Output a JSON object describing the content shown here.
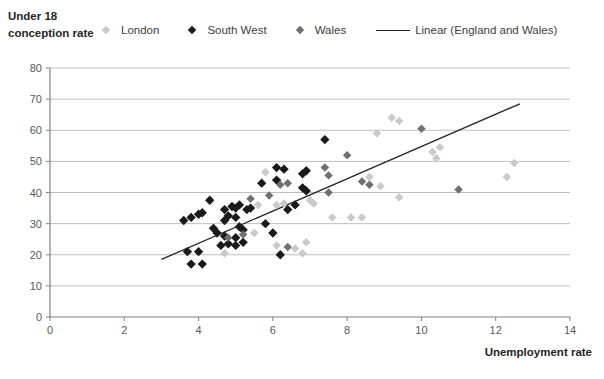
{
  "chart": {
    "y_axis_title": "Under 18\nconception rate",
    "x_axis_title": "Unemployment rate"
  },
  "legend": [
    {
      "label": "London",
      "marker": "diamond",
      "color": "#c9c9c9"
    },
    {
      "label": "South West",
      "marker": "diamond",
      "color": "#1a1a1a"
    },
    {
      "label": "Wales",
      "marker": "diamond",
      "color": "#707070"
    },
    {
      "label": "Linear (England and Wales)",
      "marker": "line",
      "color": "#262626"
    }
  ],
  "colors": {
    "gridline": "#bfbfbf",
    "axis": "#808080",
    "tick_label": "#595959",
    "trendline": "#262626"
  },
  "chart_data": {
    "type": "scatter",
    "title": "",
    "xlabel": "Unemployment rate",
    "ylabel": "Under 18 conception rate",
    "xlim": [
      0,
      14
    ],
    "ylim": [
      0,
      80
    ],
    "xticks": [
      0,
      2,
      4,
      6,
      8,
      10,
      12,
      14
    ],
    "yticks": [
      0,
      10,
      20,
      30,
      40,
      50,
      60,
      70,
      80
    ],
    "grid": true,
    "legend_position": "top",
    "series": [
      {
        "name": "London",
        "color": "#c9c9c9",
        "marker": "diamond",
        "points": [
          [
            4.7,
            20.5
          ],
          [
            5.5,
            27
          ],
          [
            5.6,
            36
          ],
          [
            5.8,
            46.5
          ],
          [
            6.1,
            36
          ],
          [
            6.1,
            23
          ],
          [
            6.3,
            36.5
          ],
          [
            6.6,
            22
          ],
          [
            6.8,
            20.5
          ],
          [
            6.9,
            24
          ],
          [
            7.0,
            37.5
          ],
          [
            7.1,
            36.5
          ],
          [
            7.6,
            32
          ],
          [
            8.1,
            32
          ],
          [
            8.4,
            32
          ],
          [
            8.6,
            45
          ],
          [
            8.8,
            59
          ],
          [
            8.9,
            42
          ],
          [
            9.2,
            64
          ],
          [
            9.4,
            63
          ],
          [
            9.4,
            38.5
          ],
          [
            10.3,
            53
          ],
          [
            10.4,
            51
          ],
          [
            10.5,
            54.5
          ],
          [
            12.3,
            45
          ],
          [
            12.5,
            49.5
          ]
        ]
      },
      {
        "name": "South West",
        "color": "#1a1a1a",
        "marker": "diamond",
        "points": [
          [
            3.6,
            31
          ],
          [
            3.7,
            21
          ],
          [
            3.8,
            32
          ],
          [
            3.8,
            17
          ],
          [
            4.0,
            33
          ],
          [
            4.0,
            21
          ],
          [
            4.1,
            17
          ],
          [
            4.1,
            33.5
          ],
          [
            4.3,
            37.5
          ],
          [
            4.4,
            28.5
          ],
          [
            4.5,
            27
          ],
          [
            4.6,
            23
          ],
          [
            4.7,
            34.5
          ],
          [
            4.7,
            31
          ],
          [
            4.7,
            26
          ],
          [
            4.8,
            32.5
          ],
          [
            4.8,
            23.5
          ],
          [
            4.9,
            35.5
          ],
          [
            5.0,
            35
          ],
          [
            5.0,
            32
          ],
          [
            5.0,
            25.5
          ],
          [
            5.0,
            23
          ],
          [
            5.1,
            36
          ],
          [
            5.1,
            29
          ],
          [
            5.2,
            28
          ],
          [
            5.2,
            24
          ],
          [
            5.3,
            34.5
          ],
          [
            5.4,
            35
          ],
          [
            5.7,
            43
          ],
          [
            5.8,
            30
          ],
          [
            6.0,
            27
          ],
          [
            6.1,
            48
          ],
          [
            6.1,
            44
          ],
          [
            6.2,
            20
          ],
          [
            6.3,
            47.5
          ],
          [
            6.4,
            34.5
          ],
          [
            6.6,
            36
          ],
          [
            6.8,
            46
          ],
          [
            6.8,
            41.5
          ],
          [
            6.9,
            40.5
          ],
          [
            6.9,
            47
          ],
          [
            7.4,
            57
          ]
        ]
      },
      {
        "name": "Wales",
        "color": "#707070",
        "marker": "diamond",
        "points": [
          [
            4.8,
            25.5
          ],
          [
            5.2,
            26.5
          ],
          [
            5.4,
            38
          ],
          [
            5.9,
            39
          ],
          [
            6.2,
            42.5
          ],
          [
            6.4,
            43
          ],
          [
            6.4,
            22.5
          ],
          [
            7.4,
            48
          ],
          [
            7.5,
            45.5
          ],
          [
            7.5,
            40
          ],
          [
            8.0,
            52
          ],
          [
            8.4,
            43.5
          ],
          [
            8.6,
            42.5
          ],
          [
            10.0,
            60.5
          ],
          [
            11.0,
            41
          ]
        ]
      }
    ],
    "trendline": {
      "name": "Linear (England and Wales)",
      "x1": 3.0,
      "y1": 18.5,
      "x2": 12.65,
      "y2": 68.5
    }
  }
}
